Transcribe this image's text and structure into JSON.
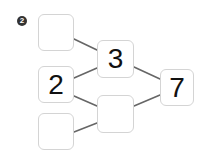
{
  "problem": {
    "number_badge": "2"
  },
  "diagram": {
    "line_color": "#666666",
    "box_border_color": "#d4d4d4",
    "boxes": {
      "top_left": "",
      "mid_left": "2",
      "bottom_left": "",
      "mid_top": "3",
      "mid_bottom": "",
      "right": "7"
    },
    "connections": [
      {
        "from": "top_left",
        "to": "mid_top"
      },
      {
        "from": "mid_left",
        "to": "mid_top"
      },
      {
        "from": "mid_left",
        "to": "mid_bottom"
      },
      {
        "from": "bottom_left",
        "to": "mid_bottom"
      },
      {
        "from": "mid_top",
        "to": "right"
      },
      {
        "from": "mid_bottom",
        "to": "right"
      }
    ]
  }
}
